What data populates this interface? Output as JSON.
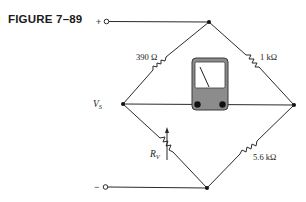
{
  "figure": {
    "title": "FIGURE 7–89"
  },
  "circuit": {
    "type": "Wheatstone bridge",
    "terminals": {
      "positive": "+",
      "negative": "−",
      "source_label": "V",
      "source_subscript": "S"
    },
    "components": [
      {
        "id": "r1",
        "position": "top-left arm",
        "label": "390 Ω",
        "kind": "resistor"
      },
      {
        "id": "r2",
        "position": "top-right arm",
        "label": "1 kΩ",
        "kind": "resistor"
      },
      {
        "id": "rv",
        "position": "bottom-left arm",
        "label": "R",
        "label_subscript": "V",
        "kind": "variable resistor"
      },
      {
        "id": "r3",
        "position": "bottom-right arm",
        "label": "5.6 kΩ",
        "kind": "resistor"
      },
      {
        "id": "meter",
        "position": "center bridge",
        "kind": "analog meter (galvanometer)"
      }
    ],
    "colors": {
      "wire": "#2a2a2a",
      "meter_body": "#8c8c8c",
      "meter_face": "#ffffff",
      "terminal_dot": "#111111"
    }
  }
}
